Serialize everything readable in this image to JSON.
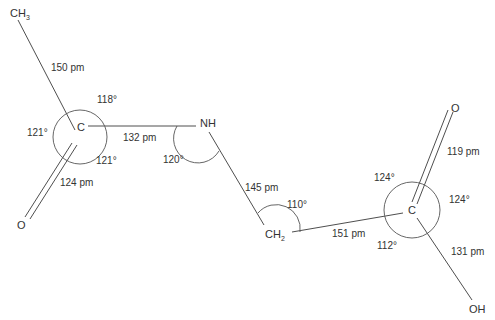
{
  "atoms": {
    "ch3": {
      "main": "CH",
      "sub": "3"
    },
    "c1": "C",
    "o1": "O",
    "nh": "NH",
    "ch2": {
      "main": "CH",
      "sub": "2"
    },
    "c2": "C",
    "o2": "O",
    "oh": "OH"
  },
  "bond_lengths": {
    "ch3_c1": "150 pm",
    "c1_n": "132 pm",
    "c1_o": "124 pm",
    "n_ch2": "145 pm",
    "ch2_c2": "151 pm",
    "c2_o": "119 pm",
    "c2_oh": "131 pm"
  },
  "bond_angles": {
    "c1_top": "118°",
    "c1_left": "121°",
    "c1_bottom": "121°",
    "n": "120°",
    "ch2": "110°",
    "c2_top": "124°",
    "c2_right": "124°",
    "c2_bottom": "112°"
  }
}
